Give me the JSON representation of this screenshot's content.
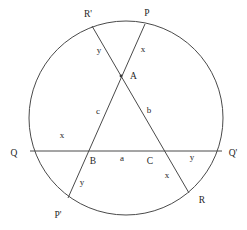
{
  "figure": {
    "background_color": "#ffffff",
    "stroke_color": "#4a4a4a",
    "text_color": "#1f1f1f",
    "circle": {
      "cx": 126,
      "cy": 118,
      "r": 97
    },
    "point_labels": [
      {
        "name": "R-prime",
        "text": "R'",
        "x": 88,
        "y": 17,
        "anchor": "middle"
      },
      {
        "name": "P",
        "text": "P",
        "x": 147,
        "y": 16,
        "anchor": "middle"
      },
      {
        "name": "A",
        "text": "A",
        "x": 130,
        "y": 79,
        "anchor": "start"
      },
      {
        "name": "Q",
        "text": "Q",
        "x": 14,
        "y": 156,
        "anchor": "middle"
      },
      {
        "name": "B",
        "text": "B",
        "x": 93,
        "y": 164,
        "anchor": "middle"
      },
      {
        "name": "C",
        "text": "C",
        "x": 150,
        "y": 164,
        "anchor": "middle"
      },
      {
        "name": "Q-prime",
        "text": "Q'",
        "x": 233,
        "y": 156,
        "anchor": "middle"
      },
      {
        "name": "P-prime",
        "text": "P'",
        "x": 58,
        "y": 218,
        "anchor": "middle"
      },
      {
        "name": "R",
        "text": "R",
        "x": 202,
        "y": 203,
        "anchor": "middle"
      }
    ],
    "segment_labels": [
      {
        "name": "arc-label-y-top-left",
        "text": "y",
        "x": 99,
        "y": 53
      },
      {
        "name": "arc-label-x-top-right",
        "text": "x",
        "x": 143,
        "y": 52
      },
      {
        "name": "segment-label-c",
        "text": "c",
        "x": 98,
        "y": 114
      },
      {
        "name": "segment-label-b",
        "text": "b",
        "x": 149,
        "y": 113
      },
      {
        "name": "arc-label-x-left",
        "text": "x",
        "x": 62,
        "y": 138
      },
      {
        "name": "segment-label-a",
        "text": "a",
        "x": 122,
        "y": 161
      },
      {
        "name": "arc-label-y-right",
        "text": "y",
        "x": 192,
        "y": 160
      },
      {
        "name": "arc-label-y-bottom-left",
        "text": "y",
        "x": 82,
        "y": 185
      },
      {
        "name": "arc-label-x-bottom-right",
        "text": "x",
        "x": 167,
        "y": 178
      }
    ],
    "chords": [
      {
        "name": "chord-P-to-P-prime",
        "from": {
          "label": "P",
          "x": 145,
          "y": 24
        },
        "to": {
          "label": "P'",
          "x": 68,
          "y": 198
        }
      },
      {
        "name": "chord-R-prime-to-R",
        "from": {
          "label": "R'",
          "x": 92,
          "y": 26
        },
        "to": {
          "label": "R",
          "x": 189,
          "y": 193
        }
      },
      {
        "name": "chord-Q-to-Q-prime",
        "from": {
          "label": "Q",
          "x": 30,
          "y": 151
        },
        "to": {
          "label": "Q'",
          "x": 222,
          "y": 151
        }
      }
    ],
    "intersections": [
      {
        "name": "point-A",
        "label": "A",
        "x": 121,
        "y": 76
      },
      {
        "name": "point-B",
        "label": "B",
        "x": 93,
        "y": 151
      },
      {
        "name": "point-C",
        "label": "C",
        "x": 151,
        "y": 151
      }
    ]
  }
}
